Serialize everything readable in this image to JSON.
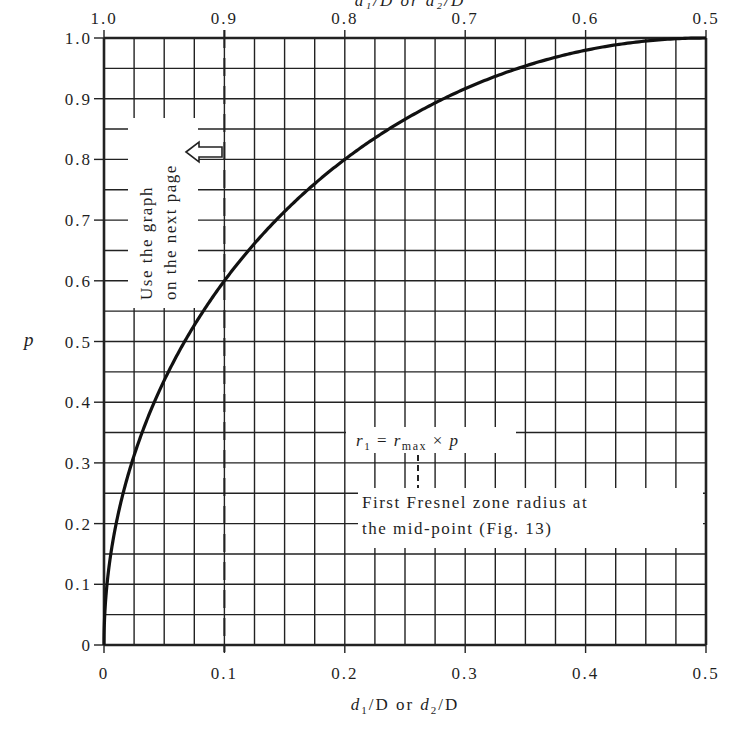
{
  "chart_data": {
    "type": "line",
    "title": "",
    "top_axis_label_partial": "d1/D or d2/D",
    "xlabel": "d1/D or d2/D",
    "ylabel": "p",
    "xlim": [
      0,
      0.5
    ],
    "ylim": [
      0,
      1.0
    ],
    "grid": true,
    "x_ticks": [
      "0",
      "0.1",
      "0.2",
      "0.3",
      "0.4",
      "0.5"
    ],
    "x_ticks_top": [
      "1.0",
      "0.9",
      "0.8",
      "0.7",
      "0.6",
      "0.5"
    ],
    "y_ticks": [
      "0",
      "0.1",
      "0.2",
      "0.3",
      "0.4",
      "0.5",
      "0.6",
      "0.7",
      "0.8",
      "0.9",
      "1.0"
    ],
    "minor_grid": {
      "x_step": 0.025,
      "y_step": 0.05
    },
    "series": [
      {
        "name": "p = 2*sqrt(x(1-x))",
        "x": [
          0,
          0.005,
          0.01,
          0.02,
          0.03,
          0.05,
          0.075,
          0.1,
          0.125,
          0.15,
          0.2,
          0.25,
          0.3,
          0.35,
          0.4,
          0.45,
          0.5
        ],
        "values": [
          0,
          0.141,
          0.199,
          0.28,
          0.341,
          0.436,
          0.527,
          0.6,
          0.661,
          0.714,
          0.8,
          0.866,
          0.917,
          0.954,
          0.98,
          0.995,
          1.0
        ]
      }
    ],
    "reference_lines": [
      {
        "type": "vertical-dashed",
        "x": 0.1
      },
      {
        "type": "vertical-dashed-short",
        "x": 0.26
      }
    ],
    "annotations": [
      {
        "text_line1": "Use the graph",
        "text_line2": "on the next page",
        "rotation": -90,
        "arrow": "left-pointing hollow arrow"
      },
      {
        "formula": "r1 = rmax × p"
      },
      {
        "text_line1": "First Fresnel zone radius at",
        "text_line2": "the mid-point (Fig. 13)"
      }
    ]
  },
  "labels": {
    "top_partial": "d₁/D or d₂/D",
    "p": "p",
    "xlabel_d1": "d",
    "xlabel_sub1": "1",
    "xlabel_mid": "/D or ",
    "xlabel_d2": "d",
    "xlabel_sub2": "2",
    "xlabel_end": "/D",
    "note_line1": "Use the graph",
    "note_line2": "on the next page",
    "formula_r": "r",
    "formula_sub1": "1",
    "formula_eq": " = ",
    "formula_r2": "r",
    "formula_max": "max",
    "formula_times": " × ",
    "formula_p": "p",
    "fresnel_line1": "First Fresnel zone radius at",
    "fresnel_line2": "the mid-point (Fig. 13)"
  }
}
